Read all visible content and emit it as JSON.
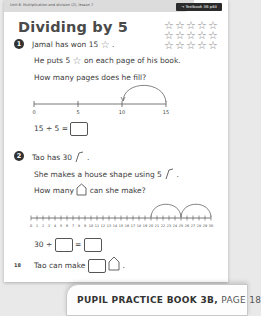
{
  "header": {
    "unit_label": "Unit 6: Multiplication and division (2), lesson 7",
    "textbook_link": "→ Textbook 3B p84"
  },
  "title": "Dividing by 5",
  "star_grid": {
    "rows": 3,
    "cols": 5,
    "total": 15,
    "icon": "star-outline-icon"
  },
  "questions": [
    {
      "number": "1",
      "lines": [
        {
          "before": "Jamal has won 15",
          "icon": "star-icon",
          "after": "."
        },
        {
          "before": "He puts 5",
          "icon": "star-icon",
          "after": "on each page of his book."
        },
        {
          "text": "How many pages does he fill?"
        }
      ],
      "number_line": {
        "start": 0,
        "end": 15,
        "labels": [
          "0",
          "5",
          "10",
          "15"
        ],
        "arcs": [
          {
            "from": 15,
            "to": 10
          }
        ]
      },
      "equation": {
        "left": "15 ÷ 5 =",
        "answer": ""
      }
    },
    {
      "number": "2",
      "lines": [
        {
          "before": "Tao has 30",
          "icon": "straw-icon",
          "after": "."
        },
        {
          "before": "She makes a house shape using 5",
          "icon": "straw-icon",
          "after": "."
        },
        {
          "before": "How many",
          "icon": "house-icon",
          "after": "can she make?"
        }
      ],
      "number_line": {
        "start": 0,
        "end": 30,
        "labels": [
          "0",
          "1",
          "2",
          "3",
          "4",
          "5",
          "6",
          "7",
          "8",
          "9",
          "10",
          "11",
          "12",
          "13",
          "14",
          "15",
          "16",
          "17",
          "18",
          "19",
          "20",
          "21",
          "22",
          "23",
          "24",
          "25",
          "26",
          "27",
          "28",
          "29",
          "30"
        ],
        "arcs": [
          {
            "from": 20,
            "to": 25
          },
          {
            "from": 25,
            "to": 30
          }
        ]
      },
      "equation": {
        "left": "30 ÷",
        "divisor": "",
        "equals": "=",
        "answer": ""
      },
      "conclusion": {
        "before": "Tao can make",
        "answer": "",
        "icon": "house-icon",
        "after": "."
      }
    }
  ],
  "page_number": "18",
  "footer": {
    "book": "PUPIL PRACTICE BOOK 3B,",
    "page": "PAGE 18"
  }
}
